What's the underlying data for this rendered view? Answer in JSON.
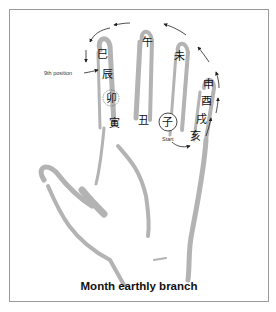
{
  "diagram": {
    "caption": "Month earthly branch",
    "annotation_9th": "9th position",
    "start_label": "Start",
    "branches": {
      "zi": "子",
      "chou": "丑",
      "yin": "寅",
      "mao": "卯",
      "chen": "辰",
      "si": "巳",
      "wu": "午",
      "wei": "未",
      "shen": "申",
      "you": "酉",
      "xu": "戌",
      "hai": "亥"
    },
    "colors": {
      "hand_shading": "#b3b3b3",
      "frame": "#9a9a9a",
      "text": "#111111",
      "arrow": "#222222"
    }
  }
}
